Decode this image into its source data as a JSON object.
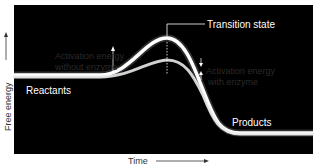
{
  "diagram": {
    "axes": {
      "y_label": "Free energy",
      "x_label": "Time"
    },
    "labels": {
      "transition_state": "Transition state",
      "reactants": "Reactants",
      "products": "Products",
      "activation_without_enzyme_line1": "Activation energy",
      "activation_without_enzyme_line2": "without enzyme",
      "activation_with_enzyme_line1": "Activation energy",
      "activation_with_enzyme_line2": "with enzyme"
    },
    "curves": [
      {
        "name": "without enzyme",
        "peak_y": 38
      },
      {
        "name": "with enzyme",
        "peak_y": 60
      }
    ],
    "colors": {
      "background": "#000000",
      "curve": "#ffffff",
      "annotation_text": "#2a2a2a",
      "page": "#ffffff"
    }
  }
}
